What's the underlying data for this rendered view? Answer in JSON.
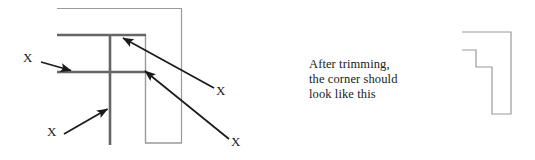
{
  "figure": {
    "background_color": "#ffffff",
    "stroke_dark": "#1a1a1a",
    "stroke_thick": "#595959",
    "stroke_thin": "#9a9a9a"
  },
  "left_diagram": {
    "name": "untrimmed-corner-diagram",
    "description": "overlapping molding corner with four trim marks",
    "thick_lines": [
      {
        "name": "upper-horizontal-rail",
        "x1": 57,
        "y1": 35,
        "x2": 146,
        "y2": 35
      },
      {
        "name": "lower-horizontal-rail",
        "x1": 57,
        "y1": 72,
        "x2": 146,
        "y2": 72
      },
      {
        "name": "vertical-stile",
        "x1": 110,
        "y1": 35,
        "x2": 110,
        "y2": 145
      }
    ],
    "thin_lines": [
      {
        "name": "outer-top-edge",
        "x1": 57,
        "y1": 8,
        "x2": 182,
        "y2": 8
      },
      {
        "name": "outer-right-edge",
        "x1": 182,
        "y1": 8,
        "x2": 182,
        "y2": 143
      },
      {
        "name": "inner-right-stile-edge",
        "x1": 146,
        "y1": 35,
        "x2": 146,
        "y2": 143
      },
      {
        "name": "bottom-edge",
        "x1": 146,
        "y1": 143,
        "x2": 182,
        "y2": 143
      }
    ],
    "markers": [
      {
        "name": "trim-mark-left",
        "label": "X",
        "label_x": 26,
        "label_y": 57,
        "arrow_from": [
          41,
          62
        ],
        "arrow_to": [
          73,
          71
        ]
      },
      {
        "name": "trim-mark-bottom",
        "label": "X",
        "label_x": 50,
        "label_y": 131,
        "arrow_from": [
          64,
          134
        ],
        "arrow_to": [
          109,
          108
        ]
      },
      {
        "name": "trim-mark-upper-right",
        "label": "X",
        "label_x": 219,
        "label_y": 90,
        "arrow_from": [
          214,
          89
        ],
        "arrow_to": [
          122,
          37
        ]
      },
      {
        "name": "trim-mark-lower-right",
        "label": "X",
        "label_x": 234,
        "label_y": 142,
        "arrow_from": [
          229,
          140
        ],
        "arrow_to": [
          144,
          70
        ]
      }
    ]
  },
  "caption": {
    "name": "trimming-caption",
    "lines": [
      "After trimming,",
      "the corner should",
      "look like this"
    ]
  },
  "right_diagram": {
    "name": "trimmed-corner-diagram",
    "description": "stepped corner profile after trimming",
    "outline_points": "463,32 511,32 511,112 493,112 493,68 476,68 476,50 463,50",
    "stroke_color": "#9a9a9a"
  }
}
